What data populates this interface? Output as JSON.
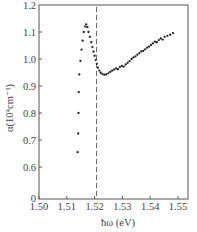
{
  "chart_data": {
    "type": "scatter",
    "title": "",
    "xlabel": "ħω (eV)",
    "ylabel": "α(10⁴cm⁻¹)",
    "xlim": [
      1.5,
      1.555
    ],
    "ylim": [
      0,
      1.2
    ],
    "y_axis_break": {
      "between": [
        0,
        0.6
      ]
    },
    "x_ticks": [
      "1.50",
      "1.51",
      "1.52",
      "1.53",
      "1.54",
      "1.55"
    ],
    "y_ticks": [
      "0",
      "0.6",
      "0.7",
      "0.8",
      "0.9",
      "1.0",
      "1.1",
      "1.2"
    ],
    "grid": false,
    "legend": null,
    "annotations": [
      {
        "type": "vertical-dashed-line",
        "x": 1.5207
      }
    ],
    "series": [
      {
        "name": "absorption",
        "marker": "dot",
        "color": "#222222",
        "points": [
          [
            1.5139,
            0.655
          ],
          [
            1.5141,
            0.724
          ],
          [
            1.5142,
            0.8
          ],
          [
            1.5143,
            0.877
          ],
          [
            1.5145,
            0.943
          ],
          [
            1.5149,
            0.993
          ],
          [
            1.5153,
            1.035
          ],
          [
            1.5157,
            1.068
          ],
          [
            1.5161,
            1.1
          ],
          [
            1.5166,
            1.12
          ],
          [
            1.517,
            1.128
          ],
          [
            1.5174,
            1.118
          ],
          [
            1.5178,
            1.1
          ],
          [
            1.5183,
            1.082
          ],
          [
            1.5188,
            1.062
          ],
          [
            1.5192,
            1.044
          ],
          [
            1.5196,
            1.027
          ],
          [
            1.52,
            1.012
          ],
          [
            1.5204,
            0.996
          ],
          [
            1.5208,
            0.982
          ],
          [
            1.5212,
            0.968
          ],
          [
            1.5217,
            0.957
          ],
          [
            1.5222,
            0.949
          ],
          [
            1.5228,
            0.944
          ],
          [
            1.5235,
            0.942
          ],
          [
            1.5242,
            0.943
          ],
          [
            1.5249,
            0.947
          ],
          [
            1.5256,
            0.952
          ],
          [
            1.5263,
            0.957
          ],
          [
            1.527,
            0.961
          ],
          [
            1.5277,
            0.965
          ],
          [
            1.5284,
            0.962
          ],
          [
            1.5291,
            0.97
          ],
          [
            1.5298,
            0.974
          ],
          [
            1.5305,
            0.972
          ],
          [
            1.5312,
            0.98
          ],
          [
            1.5319,
            0.986
          ],
          [
            1.5326,
            0.992
          ],
          [
            1.5333,
            1.0
          ],
          [
            1.534,
            1.006
          ],
          [
            1.5347,
            1.01
          ],
          [
            1.5354,
            1.016
          ],
          [
            1.5361,
            1.022
          ],
          [
            1.5368,
            1.028
          ],
          [
            1.5375,
            1.03
          ],
          [
            1.5382,
            1.036
          ],
          [
            1.5389,
            1.042
          ],
          [
            1.5396,
            1.046
          ],
          [
            1.5403,
            1.052
          ],
          [
            1.541,
            1.058
          ],
          [
            1.5417,
            1.064
          ],
          [
            1.5424,
            1.062
          ],
          [
            1.5431,
            1.07
          ],
          [
            1.5438,
            1.076
          ],
          [
            1.5445,
            1.072
          ],
          [
            1.5452,
            1.082
          ],
          [
            1.5462,
            1.086
          ],
          [
            1.5472,
            1.09
          ],
          [
            1.5482,
            1.096
          ]
        ]
      }
    ]
  },
  "plot": {
    "px_left": 39,
    "px_right": 188,
    "px_top": 5,
    "px_bottom": 199,
    "x0": 1.5,
    "px_per_unit_x": 2780,
    "y_top_val": 1.2,
    "px_per_unit_y": 270,
    "y_zero_px": 198
  }
}
